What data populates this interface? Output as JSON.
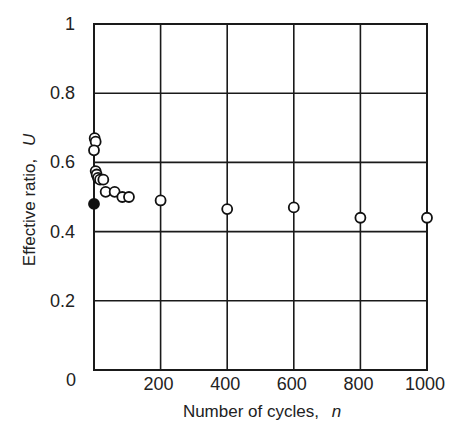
{
  "chart_data": {
    "type": "scatter",
    "title": "",
    "xlabel": "Number of cycles,",
    "xlabel_var": "n",
    "ylabel": "Effective ratio,",
    "ylabel_var": "U",
    "xlim": [
      0,
      1000
    ],
    "ylim": [
      0,
      1
    ],
    "xticks": [
      0,
      200,
      400,
      600,
      800,
      1000
    ],
    "xtick_labels": [
      "0",
      "200",
      "400",
      "600",
      "800",
      "1000"
    ],
    "yticks": [
      0,
      0.2,
      0.4,
      0.6,
      0.8,
      1
    ],
    "ytick_labels": [
      "0",
      "0.2",
      "0.4",
      "0.6",
      "0.8",
      "1"
    ],
    "grid": true,
    "legend": null,
    "series": [
      {
        "name": "open circles",
        "marker": "open-circle",
        "points": [
          {
            "x": 2,
            "y": 0.67
          },
          {
            "x": 5,
            "y": 0.66
          },
          {
            "x": 0,
            "y": 0.635
          },
          {
            "x": 5,
            "y": 0.575
          },
          {
            "x": 8,
            "y": 0.565
          },
          {
            "x": 12,
            "y": 0.555
          },
          {
            "x": 18,
            "y": 0.55
          },
          {
            "x": 28,
            "y": 0.55
          },
          {
            "x": 35,
            "y": 0.515
          },
          {
            "x": 62,
            "y": 0.515
          },
          {
            "x": 85,
            "y": 0.5
          },
          {
            "x": 105,
            "y": 0.5
          },
          {
            "x": 200,
            "y": 0.49
          },
          {
            "x": 400,
            "y": 0.465
          },
          {
            "x": 600,
            "y": 0.47
          },
          {
            "x": 800,
            "y": 0.44
          },
          {
            "x": 1000,
            "y": 0.44
          }
        ]
      },
      {
        "name": "filled circle",
        "marker": "filled-circle",
        "points": [
          {
            "x": 0,
            "y": 0.48
          }
        ]
      }
    ]
  }
}
